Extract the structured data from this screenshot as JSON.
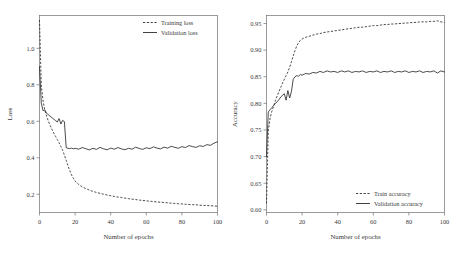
{
  "figure": {
    "panel_count": 2,
    "background": "#ffffff",
    "line_color": "#2b2b2b",
    "axis_color": "#6f6f6f"
  },
  "chart_data": [
    {
      "type": "line",
      "title": "",
      "xlabel": "Number of epochs",
      "ylabel": "Loss",
      "xlim": [
        0,
        100
      ],
      "ylim": [
        0.1,
        1.18
      ],
      "xticks": [
        0,
        20,
        40,
        60,
        80,
        100
      ],
      "xtick_labels": [
        "0",
        "20",
        "40",
        "60",
        "80",
        "100"
      ],
      "yticks": [
        0.2,
        0.4,
        0.6,
        0.8,
        1.0
      ],
      "ytick_labels": [
        "0.2",
        "0.4",
        "0.6",
        "0.8",
        "1.0"
      ],
      "grid": false,
      "legend_position": "upper right",
      "series": [
        {
          "name": "Training loss",
          "style": "dashed",
          "x": [
            0,
            1,
            2,
            3,
            4,
            5,
            6,
            7,
            8,
            9,
            10,
            11,
            12,
            13,
            14,
            15,
            16,
            17,
            18,
            19,
            20,
            21,
            22,
            23,
            24,
            25,
            26,
            27,
            28,
            29,
            30,
            32,
            34,
            36,
            38,
            40,
            42,
            44,
            46,
            48,
            50,
            52,
            54,
            56,
            58,
            60,
            62,
            64,
            66,
            68,
            70,
            72,
            74,
            76,
            78,
            80,
            82,
            84,
            86,
            88,
            90,
            92,
            94,
            96,
            98,
            100
          ],
          "values": [
            1.155,
            0.8,
            0.712,
            0.66,
            0.628,
            0.6,
            0.576,
            0.556,
            0.536,
            0.518,
            0.5,
            0.482,
            0.462,
            0.44,
            0.415,
            0.386,
            0.356,
            0.33,
            0.306,
            0.288,
            0.272,
            0.262,
            0.254,
            0.247,
            0.241,
            0.236,
            0.231,
            0.227,
            0.223,
            0.219,
            0.216,
            0.21,
            0.205,
            0.2,
            0.196,
            0.192,
            0.188,
            0.185,
            0.182,
            0.179,
            0.176,
            0.173,
            0.171,
            0.168,
            0.166,
            0.164,
            0.162,
            0.16,
            0.158,
            0.156,
            0.155,
            0.153,
            0.151,
            0.15,
            0.148,
            0.147,
            0.145,
            0.144,
            0.143,
            0.142,
            0.14,
            0.139,
            0.138,
            0.137,
            0.136,
            0.134
          ]
        },
        {
          "name": "Validation loss",
          "style": "solid",
          "x": [
            0,
            1,
            2,
            3,
            4,
            5,
            6,
            7,
            8,
            9,
            10,
            11,
            12,
            13,
            14,
            15,
            16,
            17,
            18,
            19,
            20,
            22,
            24,
            26,
            28,
            30,
            32,
            34,
            36,
            38,
            40,
            42,
            44,
            46,
            48,
            50,
            52,
            54,
            56,
            58,
            60,
            62,
            64,
            66,
            68,
            70,
            72,
            74,
            76,
            78,
            80,
            82,
            84,
            86,
            88,
            90,
            92,
            94,
            96,
            98,
            100
          ],
          "values": [
            0.9,
            0.7,
            0.658,
            0.662,
            0.645,
            0.635,
            0.628,
            0.62,
            0.612,
            0.604,
            0.596,
            0.615,
            0.585,
            0.605,
            0.598,
            0.455,
            0.452,
            0.45,
            0.453,
            0.449,
            0.452,
            0.447,
            0.456,
            0.45,
            0.443,
            0.452,
            0.446,
            0.457,
            0.449,
            0.444,
            0.453,
            0.447,
            0.456,
            0.449,
            0.444,
            0.452,
            0.447,
            0.458,
            0.451,
            0.446,
            0.455,
            0.45,
            0.46,
            0.453,
            0.449,
            0.458,
            0.453,
            0.463,
            0.457,
            0.452,
            0.461,
            0.456,
            0.467,
            0.461,
            0.457,
            0.466,
            0.462,
            0.472,
            0.468,
            0.48,
            0.488
          ]
        }
      ]
    },
    {
      "type": "line",
      "title": "",
      "xlabel": "Number of epochs",
      "ylabel": "Accuracy",
      "xlim": [
        0,
        100
      ],
      "ylim": [
        0.595,
        0.965
      ],
      "xticks": [
        0,
        20,
        40,
        60,
        80,
        100
      ],
      "xtick_labels": [
        "0",
        "20",
        "40",
        "60",
        "80",
        "100"
      ],
      "yticks": [
        0.6,
        0.65,
        0.7,
        0.75,
        0.8,
        0.85,
        0.9,
        0.95
      ],
      "ytick_labels": [
        "0.60",
        "0.65",
        "0.70",
        "0.75",
        "0.80",
        "0.85",
        "0.90",
        "0.95"
      ],
      "grid": false,
      "legend_position": "lower right",
      "series": [
        {
          "name": "Train accuracy",
          "style": "dashed",
          "x": [
            0,
            1,
            2,
            3,
            4,
            5,
            6,
            7,
            8,
            9,
            10,
            11,
            12,
            13,
            14,
            15,
            16,
            17,
            18,
            19,
            20,
            22,
            24,
            26,
            28,
            30,
            32,
            34,
            36,
            38,
            40,
            42,
            44,
            46,
            48,
            50,
            52,
            54,
            56,
            58,
            60,
            62,
            64,
            66,
            68,
            70,
            72,
            74,
            76,
            78,
            80,
            82,
            84,
            86,
            88,
            90,
            92,
            94,
            96,
            98,
            100
          ],
          "values": [
            0.612,
            0.748,
            0.772,
            0.785,
            0.795,
            0.805,
            0.814,
            0.822,
            0.83,
            0.838,
            0.845,
            0.852,
            0.859,
            0.868,
            0.878,
            0.889,
            0.899,
            0.908,
            0.914,
            0.918,
            0.921,
            0.924,
            0.926,
            0.928,
            0.93,
            0.931,
            0.933,
            0.934,
            0.935,
            0.936,
            0.937,
            0.938,
            0.939,
            0.94,
            0.941,
            0.942,
            0.943,
            0.943,
            0.944,
            0.945,
            0.946,
            0.946,
            0.947,
            0.948,
            0.948,
            0.949,
            0.949,
            0.95,
            0.95,
            0.951,
            0.951,
            0.952,
            0.952,
            0.953,
            0.953,
            0.953,
            0.954,
            0.954,
            0.955,
            0.953,
            0.952
          ]
        },
        {
          "name": "Validation accuracy",
          "style": "solid",
          "x": [
            0,
            1,
            2,
            3,
            4,
            5,
            6,
            7,
            8,
            9,
            10,
            11,
            12,
            13,
            14,
            15,
            16,
            17,
            18,
            19,
            20,
            22,
            24,
            26,
            28,
            30,
            32,
            34,
            36,
            38,
            40,
            42,
            44,
            46,
            48,
            50,
            52,
            54,
            56,
            58,
            60,
            62,
            64,
            66,
            68,
            70,
            72,
            74,
            76,
            78,
            80,
            82,
            84,
            86,
            88,
            90,
            92,
            94,
            96,
            98,
            100
          ],
          "values": [
            0.7,
            0.784,
            0.788,
            0.792,
            0.796,
            0.8,
            0.803,
            0.807,
            0.812,
            0.815,
            0.818,
            0.806,
            0.824,
            0.81,
            0.822,
            0.845,
            0.85,
            0.852,
            0.851,
            0.854,
            0.853,
            0.856,
            0.855,
            0.858,
            0.857,
            0.86,
            0.858,
            0.861,
            0.859,
            0.86,
            0.858,
            0.861,
            0.859,
            0.861,
            0.858,
            0.86,
            0.859,
            0.861,
            0.858,
            0.86,
            0.859,
            0.861,
            0.858,
            0.86,
            0.859,
            0.861,
            0.858,
            0.86,
            0.859,
            0.861,
            0.858,
            0.86,
            0.859,
            0.861,
            0.858,
            0.86,
            0.859,
            0.861,
            0.857,
            0.861,
            0.859
          ]
        }
      ]
    }
  ]
}
